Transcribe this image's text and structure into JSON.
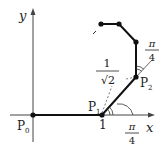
{
  "diagram": {
    "axes": {
      "x_label": "x",
      "y_label": "y"
    },
    "points": {
      "p0": {
        "label": "P",
        "sub": "0"
      },
      "p1": {
        "label": "P",
        "sub": "1"
      },
      "p2": {
        "label": "P",
        "sub": "2"
      }
    },
    "tick_x": "1",
    "segment_length": {
      "numer": "1",
      "denom": "√2"
    },
    "angle_bottom": {
      "numer": "π",
      "denom": "4"
    },
    "angle_top": {
      "numer": "π",
      "denom": "4"
    }
  }
}
